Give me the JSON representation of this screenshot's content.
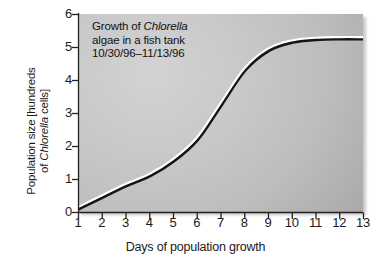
{
  "chart_data": {
    "type": "line",
    "title": "Growth of Chlorella algae in a fish tank",
    "title_lines": [
      {
        "pre": "Growth of ",
        "italic": "Chlorella",
        "post": ""
      },
      {
        "pre": "algae in a fish tank",
        "italic": "",
        "post": ""
      },
      {
        "pre": "10/30/96–11/13/96",
        "italic": "",
        "post": ""
      }
    ],
    "subtitle": "10/30/96–11/13/96",
    "xlabel": "Days of population growth",
    "ylabel": "Population size [hundreds of Chlorella cells]",
    "ylabel_lines": [
      {
        "pre": "Population size [hundreds",
        "italic": "",
        "post": ""
      },
      {
        "pre": "of ",
        "italic": "Chlorella",
        "post": " cells]"
      }
    ],
    "xlim": [
      1,
      13
    ],
    "ylim": [
      0,
      6
    ],
    "xticks": [
      1,
      2,
      3,
      4,
      5,
      6,
      7,
      8,
      9,
      10,
      11,
      12,
      13
    ],
    "yticks": [
      0,
      1,
      2,
      3,
      4,
      5,
      6
    ],
    "xtick_labels": [
      "1",
      "2",
      "3",
      "4",
      "5",
      "6",
      "7",
      "8",
      "9",
      "10",
      "11",
      "12",
      "13"
    ],
    "ytick_labels": [
      "0",
      "1",
      "2",
      "3",
      "4",
      "5",
      "6"
    ],
    "grid": false,
    "legend": false,
    "series": [
      {
        "name": "Chlorella population",
        "x": [
          1,
          2,
          3,
          4,
          5,
          6,
          7,
          8,
          9,
          10,
          11,
          12,
          13
        ],
        "values": [
          0.15,
          0.5,
          0.85,
          1.15,
          1.6,
          2.25,
          3.3,
          4.35,
          4.95,
          5.2,
          5.28,
          5.3,
          5.3
        ]
      }
    ],
    "colors": {
      "curve_highlight": "#ffffff",
      "curve_shadow": "#151515",
      "plot_background": "#c3c3c3",
      "axis": "#222222",
      "text": "#121212"
    }
  }
}
